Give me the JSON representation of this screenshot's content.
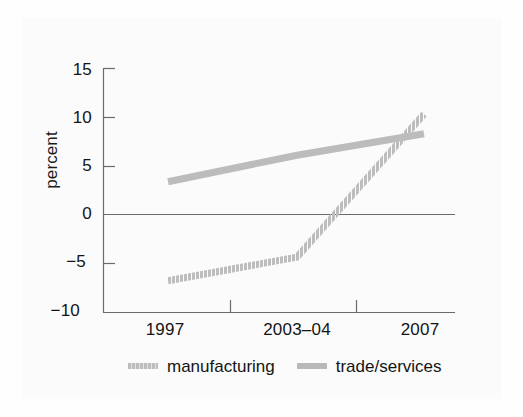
{
  "figure": {
    "background_color": "#fbfbfb",
    "line_color": "#b9b9b9",
    "axis_color": "#555555",
    "text_color": "#141414"
  },
  "chart_data": {
    "type": "line",
    "title": "",
    "xlabel": "",
    "ylabel": "percent",
    "categories": [
      "1997",
      "2003–04",
      "2007"
    ],
    "x": [
      1997,
      2003.5,
      2007
    ],
    "ylim": [
      -10,
      15
    ],
    "yticks": [
      15,
      10,
      5,
      0,
      -5,
      -10
    ],
    "ytick_labels": [
      "15",
      "10",
      "5",
      "0",
      "−5",
      "−10"
    ],
    "grid": false,
    "zero_line": true,
    "legend_position": "below",
    "series": [
      {
        "name": "manufacturing",
        "style": "dotted",
        "color": "#b9b9b9",
        "values": [
          -6.7,
          -4.3,
          10.3
        ]
      },
      {
        "name": "trade/services",
        "style": "solid",
        "color": "#b9b9b9",
        "values": [
          3.4,
          6.1,
          8.3
        ]
      }
    ],
    "annotations": []
  },
  "legend": {
    "items": [
      {
        "label": "manufacturing",
        "swatch": "dotted-line-swatch"
      },
      {
        "label": "trade/services",
        "swatch": "solid-line-swatch"
      }
    ]
  }
}
